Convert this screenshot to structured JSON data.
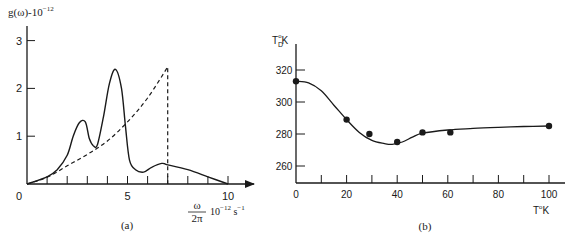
{
  "chart_data": [
    {
      "id": "a",
      "type": "line",
      "caption": "(a)",
      "ylabel": "g(ω)·10⁻¹²",
      "ylabel_parts": {
        "base": "g(ω)-10",
        "exp": "−12"
      },
      "xlabel_parts": {
        "num": "ω",
        "den": "2π",
        "unit": "10",
        "unit_exp": "−12",
        "unit_tail": " s",
        "unit_tail_exp": "−1"
      },
      "xlim": [
        0,
        10.5
      ],
      "ylim": [
        0,
        3.3
      ],
      "x_ticks": [
        0,
        1,
        2,
        3,
        4,
        5,
        6,
        7,
        8,
        9,
        10
      ],
      "x_tick_labels": [
        {
          "x": 0,
          "label": "0"
        },
        {
          "x": 5,
          "label": "5"
        },
        {
          "x": 10,
          "label": "10"
        }
      ],
      "y_tick_labels": [
        {
          "y": 1,
          "label": "1"
        },
        {
          "y": 2,
          "label": "2"
        },
        {
          "y": 3,
          "label": "3"
        }
      ],
      "grid": false,
      "series": [
        {
          "name": "actual density of states",
          "style": "solid",
          "x": [
            0,
            1,
            1.5,
            2,
            2.3,
            2.6,
            2.9,
            3.1,
            3.3,
            3.5,
            3.8,
            4.1,
            4.4,
            4.7,
            4.9,
            5.1,
            5.4,
            5.8,
            6.2,
            6.7,
            7.0,
            8.0,
            9.0,
            10.0
          ],
          "y": [
            0,
            0.15,
            0.3,
            0.6,
            1.0,
            1.28,
            1.3,
            0.95,
            0.8,
            0.82,
            1.4,
            2.1,
            2.4,
            2.0,
            1.2,
            0.5,
            0.3,
            0.25,
            0.35,
            0.43,
            0.4,
            0.3,
            0.15,
            0.0
          ]
        },
        {
          "name": "Debye approximation",
          "style": "dashed",
          "x": [
            0,
            1,
            2,
            3,
            4,
            5,
            6,
            7,
            7
          ],
          "y": [
            0,
            0.14,
            0.38,
            0.62,
            0.9,
            1.3,
            1.8,
            2.45,
            0
          ],
          "cutoff_x": 7
        }
      ]
    },
    {
      "id": "b",
      "type": "scatter",
      "caption": "(b)",
      "ylabel_parts": {
        "base": "T",
        "sub": "D",
        "sup": "o",
        "tail": "K"
      },
      "xlabel_parts": {
        "base": "T",
        "sup": "o",
        "tail": "K"
      },
      "xlim": [
        0,
        108
      ],
      "ylim": [
        250,
        328
      ],
      "x_ticks": [
        0,
        10,
        20,
        30,
        40,
        50,
        60,
        70,
        80,
        90,
        100
      ],
      "x_tick_labels": [
        {
          "x": 0,
          "label": "0"
        },
        {
          "x": 20,
          "label": "20"
        },
        {
          "x": 40,
          "label": "40"
        },
        {
          "x": 60,
          "label": "60"
        },
        {
          "x": 80,
          "label": "80"
        },
        {
          "x": 100,
          "label": "100"
        }
      ],
      "y_tick_labels": [
        {
          "y": 260,
          "label": "260"
        },
        {
          "y": 280,
          "label": "280"
        },
        {
          "y": 300,
          "label": "300"
        },
        {
          "y": 320,
          "label": "320"
        }
      ],
      "grid": false,
      "series": [
        {
          "name": "measured Debye temperature",
          "style": "markers",
          "x": [
            0,
            20,
            29,
            40,
            50,
            61,
            100
          ],
          "y": [
            313,
            289,
            280,
            275,
            281,
            281,
            285
          ]
        },
        {
          "name": "fit curve",
          "style": "solid",
          "x": [
            0,
            5,
            10,
            15,
            20,
            25,
            30,
            35,
            38,
            42,
            46,
            50,
            60,
            70,
            80,
            90,
            100
          ],
          "y": [
            313,
            312,
            307,
            298,
            289,
            281,
            276,
            274,
            273.5,
            275,
            278,
            280.5,
            282.5,
            283.5,
            284.2,
            284.7,
            285
          ]
        }
      ]
    }
  ],
  "labels": {
    "a_caption": "(a)",
    "b_caption": "(b)"
  }
}
